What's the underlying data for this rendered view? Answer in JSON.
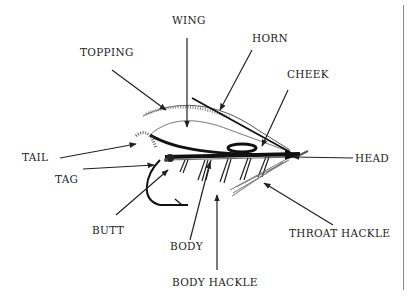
{
  "diagram": {
    "labels": {
      "wing": "WING",
      "topping": "TOPPING",
      "horn": "HORN",
      "cheek": "CHEEK",
      "tail": "TAIL",
      "tag": "TAG",
      "head": "HEAD",
      "butt": "BUTT",
      "body": "BODY",
      "throat_hackle": "THROAT HACKLE",
      "body_hackle": "BODY HACKLE"
    }
  }
}
